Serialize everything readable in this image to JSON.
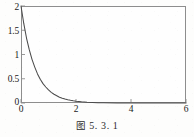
{
  "caption": {
    "prefix": "图",
    "number": "5. 3. 1",
    "full": "图 5. 3. 1"
  },
  "colors": {
    "frame": "#8d8d8d",
    "curve": "#4a4a4a",
    "text": "#1a1a1a",
    "background": "#fefefe"
  },
  "chart_data": {
    "type": "line",
    "title": "",
    "subtitle": "",
    "xlabel": "",
    "ylabel": "",
    "xlim": [
      0,
      6
    ],
    "ylim": [
      0,
      2
    ],
    "xticks": [
      0,
      2,
      4,
      6
    ],
    "xtick_labels": [
      "0",
      "2",
      "4",
      "6"
    ],
    "yticks": [
      0,
      0.5,
      1,
      1.5,
      2
    ],
    "ytick_labels": [
      "0",
      "0.5",
      "1",
      "1.5",
      "2"
    ],
    "grid": false,
    "legend": false,
    "legend_position": "none",
    "annotations": [],
    "series": [
      {
        "name": "decay",
        "description": "exponential decay from y=2 at x=0 to near 0 by x=2.2",
        "x": [
          0,
          0.1,
          0.2,
          0.3,
          0.4,
          0.5,
          0.6,
          0.7,
          0.8,
          0.9,
          1.0,
          1.1,
          1.2,
          1.3,
          1.4,
          1.5,
          1.6,
          1.7,
          1.8,
          1.9,
          2.0,
          2.2,
          2.4,
          2.6,
          2.8,
          3.0,
          3.5,
          4.0,
          4.5,
          5.0,
          5.5,
          6.0
        ],
        "values": [
          2.0,
          1.64,
          1.34,
          1.1,
          0.9,
          0.74,
          0.6,
          0.49,
          0.4,
          0.33,
          0.27,
          0.22,
          0.18,
          0.15,
          0.12,
          0.1,
          0.082,
          0.067,
          0.055,
          0.045,
          0.037,
          0.024,
          0.016,
          0.011,
          0.007,
          0.005,
          0.002,
          0.001,
          0.0004,
          0.0002,
          0.0001,
          0.0
        ]
      }
    ]
  }
}
